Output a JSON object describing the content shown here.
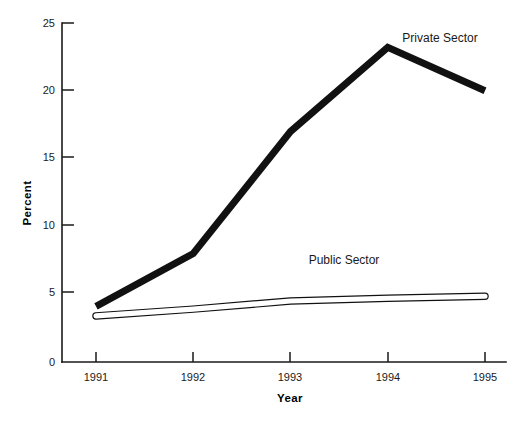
{
  "chart_data": {
    "type": "line",
    "title": "",
    "xlabel": "Year",
    "ylabel": "Percent",
    "categories": [
      "1991",
      "1992",
      "1993",
      "1994",
      "1995"
    ],
    "x": [
      1991,
      1992,
      1993,
      1994,
      1995
    ],
    "xlim": [
      1991,
      1995
    ],
    "ylim": [
      0,
      25
    ],
    "yticks": [
      "0",
      "5",
      "10",
      "15",
      "20",
      "25"
    ],
    "ytick_values": [
      0,
      5,
      10,
      15,
      20,
      25
    ],
    "grid": false,
    "legend_position": "inline-annotation",
    "series": [
      {
        "name": "Private Sector",
        "values": [
          4.1,
          8.0,
          17.0,
          23.2,
          20.0
        ],
        "style": "thick-solid-black",
        "color": "#111111",
        "label_text": "Private Sector"
      },
      {
        "name": "Public Sector",
        "values": [
          3.4,
          3.9,
          4.5,
          4.7,
          4.85
        ],
        "style": "thick-outlined-white",
        "color": "#ffffff",
        "outline_color": "#111111",
        "label_text": "Public Sector"
      }
    ],
    "annotations": [
      {
        "text": "Private Sector",
        "x": 1994.15,
        "y": 23.6
      },
      {
        "text": "Public Sector",
        "x": 1993.55,
        "y": 7.2
      }
    ]
  },
  "axes": {
    "y_title": "Percent",
    "x_title": "Year",
    "y_tick_labels": [
      "25",
      "20",
      "15",
      "10",
      "5",
      "0"
    ],
    "x_tick_labels": [
      "1991",
      "1992",
      "1993",
      "1994",
      "1995"
    ]
  },
  "colors": {
    "background": "#ffffff",
    "ink": "#1a1a1a",
    "private_series": "#111111",
    "public_series_fill": "#ffffff",
    "public_series_outline": "#111111"
  }
}
